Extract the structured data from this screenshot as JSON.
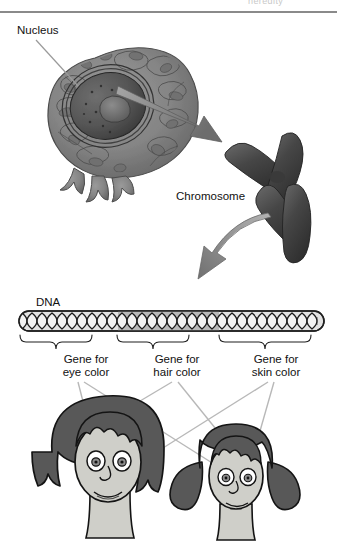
{
  "figure": {
    "title_clipped": "heredity",
    "labels": {
      "nucleus": "Nucleus",
      "chromosome": "Chromosome",
      "dna": "DNA",
      "gene_eye": "Gene for\neye color",
      "gene_hair": "Gene for\nhair color",
      "gene_skin": "Gene for\nskin color"
    },
    "icons": {
      "cell": "animal-cell-illustration",
      "chromosome": "chromosome-x-shape",
      "dna": "dna-double-helix-strand",
      "arrow_cell_to_chromosome": "arrow-straight-down-right",
      "arrow_chromosome_to_dna": "arrow-curved-down-left",
      "mother_face": "cartoon-woman-face",
      "daughter_face": "cartoon-girl-face"
    },
    "brackets": [
      {
        "name": "bracket-gene-eye",
        "label": "Gene for\neye color"
      },
      {
        "name": "bracket-gene-hair",
        "label": "Gene for\nhair color"
      },
      {
        "name": "bracket-gene-skin",
        "label": "Gene for\nskin color"
      }
    ],
    "colors": {
      "rule": "#8a8a8a",
      "text": "#111111",
      "arrow_gray": "#8e8e8e",
      "arrow_dark": "#6e6e6e",
      "chromosome_dark": "#4a4a4a",
      "hair_dark": "#5f5f5f",
      "skin_light": "#c9c9c4",
      "dna_fill": "#d8d8d8",
      "leader_line": "#b5b5b5",
      "outline": "#1a1a1a",
      "background": "#ffffff"
    }
  }
}
